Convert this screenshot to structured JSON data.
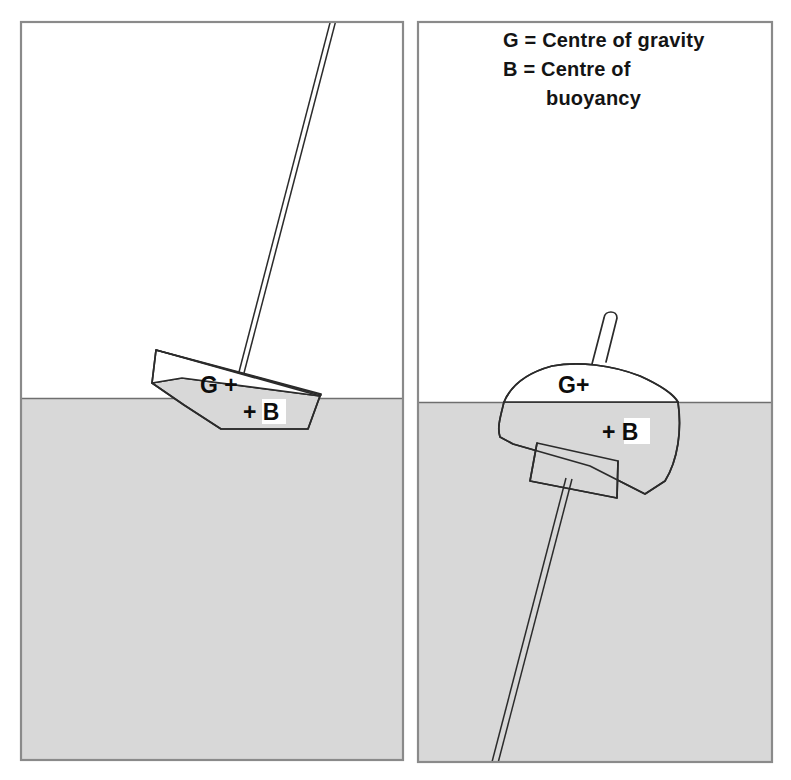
{
  "figure": {
    "background_color": "#ffffff",
    "water_color": "#d8d8d8",
    "hull_color": "#ffffff",
    "line_color": "#2b2b2b",
    "frame_color": "#8a8a8a"
  },
  "legend": {
    "name": "legend",
    "lines": [
      "G = Centre of gravity",
      "B = Centre of",
      "buoyancy"
    ],
    "line1": "G = Centre of gravity",
    "line2": "B = Centre of",
    "line3": "buoyancy"
  },
  "panels": [
    {
      "id": "left-panel",
      "name": "heeled-boat-panel",
      "caption": "",
      "waterline_y": 398,
      "markers": {
        "gravity": "G +",
        "buoyancy": "+ B"
      }
    },
    {
      "id": "right-panel",
      "name": "capsized-boat-panel",
      "caption": "",
      "waterline_y": 402,
      "markers": {
        "gravity": "G+",
        "buoyancy": "+ B"
      }
    }
  ],
  "markers": {
    "gravity_symbol": "G",
    "buoyancy_symbol": "B",
    "cross_symbol": "+",
    "left_gravity_label": "G +",
    "left_buoyancy_label": "+ B",
    "right_gravity_label": "G+",
    "right_buoyancy_label": "+ B"
  }
}
